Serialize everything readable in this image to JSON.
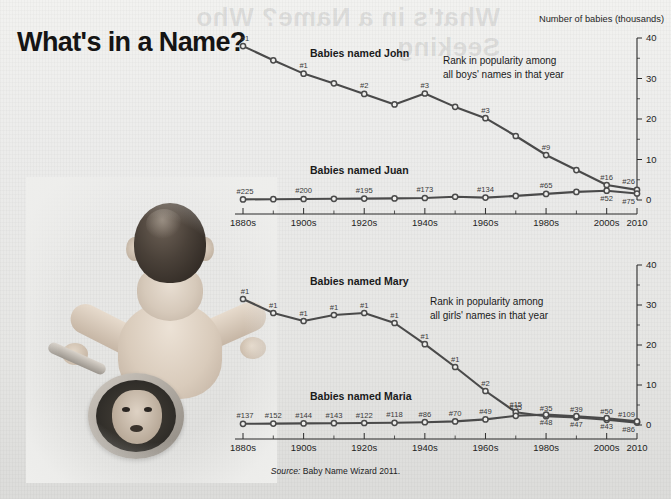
{
  "headline": "What's in a Name?",
  "ghost_text": "What's in a Name? Who Seeking",
  "unit_label": "Number of babies (thousands)",
  "source": {
    "prefix": "Source:",
    "text": "Baby Name Wizard 2011."
  },
  "colors": {
    "background": "#ececea",
    "line": "#4a4a4a",
    "marker_fill": "#efefed",
    "axis": "#2b2b2b",
    "text": "#1a1a1a"
  },
  "axis": {
    "x_ticks": [
      "1880s",
      "1900s",
      "1920s",
      "1940s",
      "1960s",
      "1980s",
      "2000s",
      "2010"
    ],
    "y_ticks": [
      "0",
      "10",
      "20",
      "30",
      "40"
    ],
    "y_min": 0,
    "y_max": 40
  },
  "chart_data": [
    {
      "type": "line",
      "title": "Babies named John / Babies named Juan",
      "note": "Rank in popularity among all boys' names in that year",
      "xlabel": "",
      "ylabel": "Number of babies (thousands)",
      "ylim": [
        0,
        40
      ],
      "grid": false,
      "legend": "inline-labels",
      "x": [
        "1880s",
        "1890s",
        "1900s",
        "1910s",
        "1920s",
        "1930s",
        "1940s",
        "1950s",
        "1960s",
        "1970s",
        "1980s",
        "1990s",
        "2000s",
        "2010"
      ],
      "series": [
        {
          "name": "Babies named John",
          "values": [
            38.0,
            34.5,
            31.2,
            28.8,
            26.2,
            23.6,
            26.3,
            23.0,
            20.2,
            15.8,
            11.1,
            7.4,
            3.7,
            2.5
          ],
          "rank_labels": [
            {
              "x": "1880s",
              "label": "#1"
            },
            {
              "x": "1900s",
              "label": "#1"
            },
            {
              "x": "1920s",
              "label": "#2"
            },
            {
              "x": "1940s",
              "label": "#3"
            },
            {
              "x": "1960s",
              "label": "#3"
            },
            {
              "x": "1980s",
              "label": "#9"
            },
            {
              "x": "2000s",
              "label": "#16"
            },
            {
              "x": "2010",
              "label": "#26"
            }
          ]
        },
        {
          "name": "Babies named Juan",
          "values": [
            0.15,
            0.2,
            0.25,
            0.3,
            0.35,
            0.4,
            0.5,
            0.8,
            0.6,
            1.0,
            1.5,
            2.0,
            2.3,
            1.6
          ],
          "rank_labels": [
            {
              "x": "1880s",
              "label": "#225"
            },
            {
              "x": "1900s",
              "label": "#200"
            },
            {
              "x": "1920s",
              "label": "#195"
            },
            {
              "x": "1940s",
              "label": "#173"
            },
            {
              "x": "1960s",
              "label": "#134"
            },
            {
              "x": "1980s",
              "label": "#65"
            },
            {
              "x": "2000s",
              "label": "#52"
            },
            {
              "x": "2010",
              "label": "#75"
            }
          ]
        }
      ]
    },
    {
      "type": "line",
      "title": "Babies named Mary / Babies named Maria",
      "note": "Rank in popularity among all girls' names in that year",
      "xlabel": "",
      "ylabel": "Number of babies (thousands)",
      "ylim": [
        0,
        40
      ],
      "grid": false,
      "legend": "inline-labels",
      "x": [
        "1880s",
        "1890s",
        "1900s",
        "1910s",
        "1920s",
        "1930s",
        "1940s",
        "1950s",
        "1960s",
        "1970s",
        "1980s",
        "1990s",
        "2000s",
        "2010"
      ],
      "series": [
        {
          "name": "Babies named Mary",
          "values": [
            31.5,
            28.0,
            26.0,
            27.5,
            28.0,
            25.5,
            20.2,
            14.5,
            8.5,
            3.2,
            2.2,
            1.9,
            1.3,
            0.6
          ],
          "rank_labels": [
            {
              "x": "1880s",
              "label": "#1"
            },
            {
              "x": "1890s",
              "label": "#1"
            },
            {
              "x": "1900s",
              "label": "#1"
            },
            {
              "x": "1910s",
              "label": "#1"
            },
            {
              "x": "1920s",
              "label": "#1"
            },
            {
              "x": "1930s",
              "label": "#1"
            },
            {
              "x": "1940s",
              "label": "#1"
            },
            {
              "x": "1950s",
              "label": "#1"
            },
            {
              "x": "1960s",
              "label": "#2"
            },
            {
              "x": "1970s",
              "label": "#15"
            },
            {
              "x": "1980s",
              "label": "#35"
            },
            {
              "x": "1990s",
              "label": "#39"
            },
            {
              "x": "2000s",
              "label": "#50"
            },
            {
              "x": "2010",
              "label": "#109"
            }
          ]
        },
        {
          "name": "Babies named Maria",
          "values": [
            0.3,
            0.35,
            0.4,
            0.45,
            0.5,
            0.55,
            0.7,
            0.9,
            1.4,
            2.3,
            2.6,
            2.2,
            1.7,
            0.9
          ],
          "rank_labels": [
            {
              "x": "1880s",
              "label": "#137"
            },
            {
              "x": "1890s",
              "label": "#152"
            },
            {
              "x": "1900s",
              "label": "#144"
            },
            {
              "x": "1910s",
              "label": "#143"
            },
            {
              "x": "1920s",
              "label": "#122"
            },
            {
              "x": "1930s",
              "label": "#118"
            },
            {
              "x": "1940s",
              "label": "#86"
            },
            {
              "x": "1950s",
              "label": "#70"
            },
            {
              "x": "1960s",
              "label": "#49"
            },
            {
              "x": "1970s",
              "label": "#35"
            },
            {
              "x": "1980s",
              "label": "#48"
            },
            {
              "x": "1990s",
              "label": "#47"
            },
            {
              "x": "2000s",
              "label": "#43"
            },
            {
              "x": "2010",
              "label": "#86"
            }
          ]
        }
      ]
    }
  ],
  "photo": {
    "alt": "baby looking into a hand mirror"
  }
}
